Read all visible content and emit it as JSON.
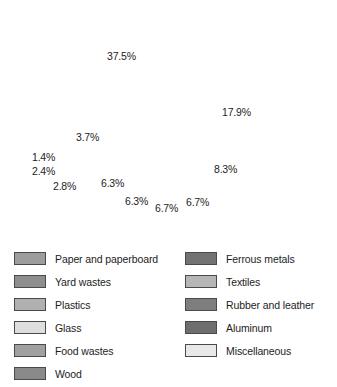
{
  "chart_data": {
    "type": "pie",
    "title": "",
    "legend_position": "bottom",
    "grid": false,
    "unit": "%",
    "start_angle_deg": 177,
    "direction": "counterclockwise",
    "categories": [
      "Paper and paperboard",
      "Yard wastes",
      "Plastics",
      "Glass",
      "Food wastes",
      "Wood",
      "Ferrous metals",
      "Textiles",
      "Rubber and leather",
      "Aluminum",
      "Miscellaneous"
    ],
    "values": [
      37.5,
      17.9,
      8.3,
      6.7,
      6.7,
      6.3,
      6.3,
      2.8,
      2.4,
      1.4,
      3.7
    ],
    "colors": [
      "#9d9d9d",
      "#8e8e8e",
      "#b0b0b0",
      "#dedede",
      "#a0a0a0",
      "#8a8a8a",
      "#737373",
      "#b6b6b6",
      "#7e7e7e",
      "#6e6e6e",
      "#e8e8e8"
    ],
    "slices": [
      {
        "label": "Paper and paperboard",
        "value": 37.5,
        "display": "37.5%",
        "color": "#9d9d9d"
      },
      {
        "label": "Yard wastes",
        "value": 17.9,
        "display": "17.9%",
        "color": "#8e8e8e"
      },
      {
        "label": "Plastics",
        "value": 8.3,
        "display": "8.3%",
        "color": "#b0b0b0"
      },
      {
        "label": "Glass",
        "value": 6.7,
        "display": "6.7%",
        "color": "#dedede"
      },
      {
        "label": "Food wastes",
        "value": 6.7,
        "display": "6.7%",
        "color": "#a0a0a0"
      },
      {
        "label": "Wood",
        "value": 6.3,
        "display": "6.3%",
        "color": "#8a8a8a"
      },
      {
        "label": "Ferrous metals",
        "value": 6.3,
        "display": "6.3%",
        "color": "#737373"
      },
      {
        "label": "Textiles",
        "value": 2.8,
        "display": "2.8%",
        "color": "#b6b6b6"
      },
      {
        "label": "Rubber and leather",
        "value": 2.4,
        "display": "2.4%",
        "color": "#7e7e7e"
      },
      {
        "label": "Aluminum",
        "value": 1.4,
        "display": "1.4%",
        "color": "#6e6e6e"
      },
      {
        "label": "Miscellaneous",
        "value": 3.7,
        "display": "3.7%",
        "color": "#e8e8e8"
      }
    ]
  },
  "pie": {
    "center_x": 164,
    "center_y": 128,
    "radius": 115,
    "stroke_color": "#2b2b2b",
    "labels": [
      {
        "text": "37.5%",
        "x": 107,
        "y": 50
      },
      {
        "text": "17.9%",
        "x": 222,
        "y": 106
      },
      {
        "text": "8.3%",
        "x": 214,
        "y": 163
      },
      {
        "text": "6.7%",
        "x": 186,
        "y": 196
      },
      {
        "text": "6.7%",
        "x": 155,
        "y": 202
      },
      {
        "text": "6.3%",
        "x": 125,
        "y": 195
      },
      {
        "text": "6.3%",
        "x": 101,
        "y": 177
      },
      {
        "text": "2.8%",
        "x": 53,
        "y": 180
      },
      {
        "text": "2.4%",
        "x": 32,
        "y": 165
      },
      {
        "text": "1.4%",
        "x": 32,
        "y": 151
      },
      {
        "text": "3.7%",
        "x": 76,
        "y": 131
      }
    ]
  },
  "legend": {
    "left_column": [
      {
        "label": "Paper and paperboard",
        "color": "#9d9d9d"
      },
      {
        "label": "Yard wastes",
        "color": "#8e8e8e"
      },
      {
        "label": "Plastics",
        "color": "#b0b0b0"
      },
      {
        "label": "Glass",
        "color": "#dedede"
      },
      {
        "label": "Food wastes",
        "color": "#a0a0a0"
      },
      {
        "label": "Wood",
        "color": "#8a8a8a"
      }
    ],
    "right_column": [
      {
        "label": "Ferrous metals",
        "color": "#737373"
      },
      {
        "label": "Textiles",
        "color": "#b6b6b6"
      },
      {
        "label": "Rubber and leather",
        "color": "#7e7e7e"
      },
      {
        "label": "Aluminum",
        "color": "#6e6e6e"
      },
      {
        "label": "Miscellaneous",
        "color": "#e8e8e8"
      }
    ]
  }
}
